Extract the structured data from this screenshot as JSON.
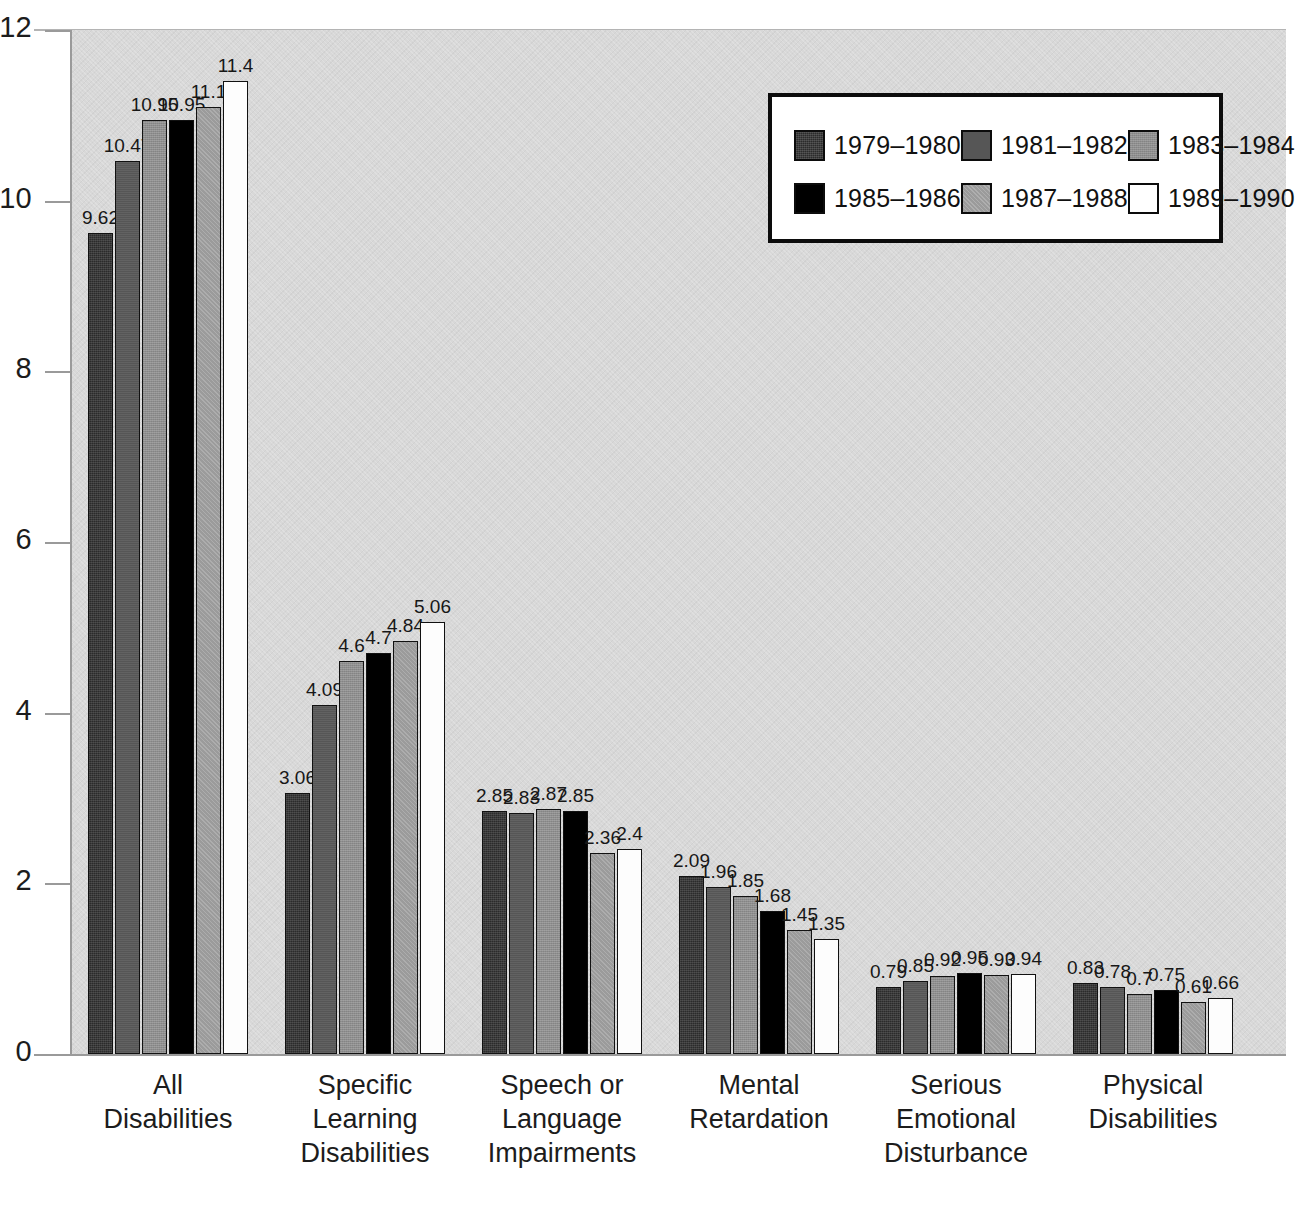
{
  "chart_data": {
    "type": "bar",
    "title": "",
    "subtitle": "",
    "xlabel": "",
    "ylabel": "",
    "ylim": [
      0,
      12
    ],
    "yticks": [
      0,
      2,
      4,
      6,
      8,
      10,
      12
    ],
    "ytick_labels": [
      "0",
      "2",
      "4",
      "6",
      "8",
      "10",
      "12"
    ],
    "grid": false,
    "legend_position": "top-right",
    "categories": [
      "All\nDisabilities",
      "Specific\nLearning\nDisabilities",
      "Speech or\nLanguage\nImpairments",
      "Mental\nRetardation",
      "Serious\nEmotional\nDisturbance",
      "Physical\nDisabilities"
    ],
    "category_lines": [
      [
        "All",
        "Disabilities"
      ],
      [
        "Specific",
        "Learning",
        "Disabilities"
      ],
      [
        "Speech or",
        "Language",
        "Impairments"
      ],
      [
        "Mental",
        "Retardation"
      ],
      [
        "Serious",
        "Emotional",
        "Disturbance"
      ],
      [
        "Physical",
        "Disabilities"
      ]
    ],
    "series": [
      {
        "name": "1979–1980",
        "color": "#2b2b2b",
        "values": [
          9.62,
          3.06,
          2.85,
          2.09,
          0.79,
          0.83
        ],
        "labels": [
          "9.62",
          "3.06",
          "2.85",
          "2.09",
          "0.79",
          "0.83"
        ]
      },
      {
        "name": "1981–1982",
        "color": "#565656",
        "values": [
          10.47,
          4.09,
          2.83,
          1.96,
          0.85,
          0.78
        ],
        "labels": [
          "10.47",
          "4.09",
          "2.83",
          "1.96",
          "0.85",
          "0.78"
        ]
      },
      {
        "name": "1983–1984",
        "color": "#8e8e8e",
        "values": [
          10.95,
          4.6,
          2.87,
          1.85,
          0.92,
          0.7
        ],
        "labels": [
          "10.95",
          "4.6",
          "2.87",
          "1.85",
          "0.92",
          "0.7"
        ]
      },
      {
        "name": "1985–1986",
        "color": "#000000",
        "values": [
          10.95,
          4.7,
          2.85,
          1.68,
          0.95,
          0.75
        ],
        "labels": [
          "10.95",
          "4.7",
          "2.85",
          "1.68",
          "0.95",
          "0.75"
        ]
      },
      {
        "name": "1987–1988",
        "color": "#9b9b9b",
        "values": [
          11.1,
          4.84,
          2.36,
          1.45,
          0.93,
          0.61
        ],
        "labels": [
          "11.1",
          "4.84",
          "2.36",
          "1.45",
          "0.93",
          "0.61"
        ]
      },
      {
        "name": "1989–1990",
        "color": "#ffffff",
        "values": [
          11.4,
          5.06,
          2.4,
          1.35,
          0.94,
          0.66
        ],
        "labels": [
          "11.4",
          "5.06",
          "2.4",
          "1.35",
          "0.94",
          "0.66"
        ]
      }
    ]
  },
  "legend": {
    "items": [
      {
        "label": "1979–1980"
      },
      {
        "label": "1981–1982"
      },
      {
        "label": "1983–1984"
      },
      {
        "label": "1985–1986"
      },
      {
        "label": "1987–1988"
      },
      {
        "label": "1989–1990"
      }
    ]
  },
  "caption": {
    "text": ""
  }
}
